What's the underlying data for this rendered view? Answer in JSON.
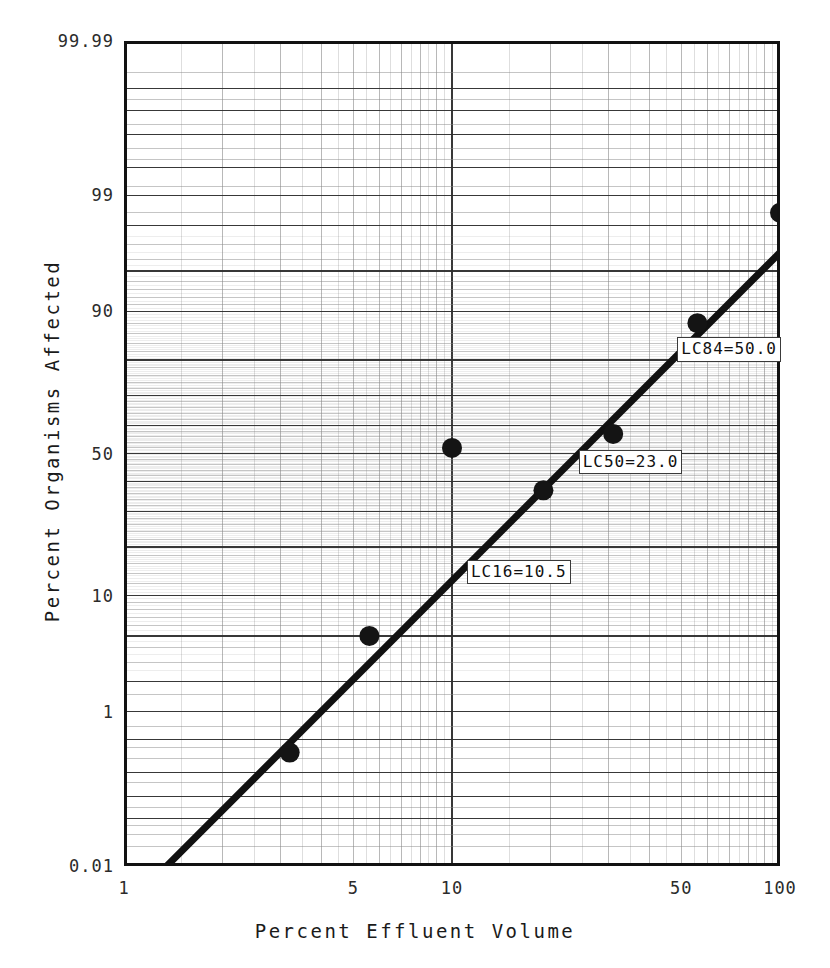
{
  "chart_data": {
    "type": "scatter",
    "title": "",
    "xlabel": "Percent Effluent Volume",
    "ylabel": "Percent Organisms Affected",
    "x_scale": "log",
    "y_scale": "probit",
    "xlim": [
      1,
      100
    ],
    "ylim": [
      0.01,
      99.99
    ],
    "grid": true,
    "legend": "none",
    "x_ticks": [
      {
        "value": 1,
        "label": "1"
      },
      {
        "value": 5,
        "label": "5"
      },
      {
        "value": 10,
        "label": "10"
      },
      {
        "value": 50,
        "label": "50"
      },
      {
        "value": 100,
        "label": "100"
      }
    ],
    "y_ticks": [
      {
        "value": 99.99,
        "label": "99.99"
      },
      {
        "value": 99,
        "label": "99"
      },
      {
        "value": 90,
        "label": "90"
      },
      {
        "value": 50,
        "label": "50"
      },
      {
        "value": 10,
        "label": "10"
      },
      {
        "value": 1,
        "label": "1"
      },
      {
        "value": 0.01,
        "label": "0.01"
      }
    ],
    "series": [
      {
        "name": "Observed mortality",
        "marker": "filled-circle",
        "points": [
          {
            "x": 3.2,
            "y": 0.35
          },
          {
            "x": 5.6,
            "y": 5.0
          },
          {
            "x": 10.0,
            "y": 52.0
          },
          {
            "x": 19.0,
            "y": 37.0
          },
          {
            "x": 31.0,
            "y": 57.0
          },
          {
            "x": 56.0,
            "y": 88.0
          },
          {
            "x": 100.0,
            "y": 98.5
          }
        ]
      },
      {
        "name": "Fitted probit regression line",
        "marker": "line",
        "points": [
          {
            "x": 1.35,
            "y": 0.01
          },
          {
            "x": 100.0,
            "y": 96.5
          }
        ]
      }
    ],
    "annotations": [
      {
        "id": "lc16",
        "text": "LC16=10.5",
        "x": 10.5,
        "y": 16
      },
      {
        "id": "lc50",
        "text": "LC50=23.0",
        "x": 23.0,
        "y": 50
      },
      {
        "id": "lc84",
        "text": "LC84=50.0",
        "x": 50.0,
        "y": 84
      }
    ]
  },
  "axis_titles": {
    "x": "Percent Effluent Volume",
    "y": "Percent Organisms Affected"
  },
  "colors": {
    "axis": "#121212",
    "grid_major": "#2e2e2e",
    "grid_minor": "#8a8a8a",
    "marker": "#141414",
    "fit_line": "#111111",
    "background": "#ffffff"
  }
}
